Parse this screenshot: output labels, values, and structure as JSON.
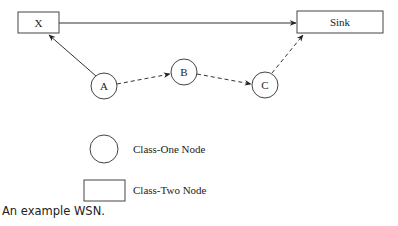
{
  "diagram": {
    "nodes": {
      "x": {
        "label": "X",
        "type": "class-two"
      },
      "sink": {
        "label": "Sink",
        "type": "class-two"
      },
      "a": {
        "label": "A",
        "type": "class-one"
      },
      "b": {
        "label": "B",
        "type": "class-one"
      },
      "c": {
        "label": "C",
        "type": "class-one"
      }
    },
    "edges": [
      {
        "from": "A",
        "to": "X",
        "style": "solid"
      },
      {
        "from": "X",
        "to": "Sink",
        "style": "solid"
      },
      {
        "from": "A",
        "to": "B",
        "style": "dashed"
      },
      {
        "from": "B",
        "to": "C",
        "style": "dashed"
      },
      {
        "from": "C",
        "to": "Sink",
        "style": "dashed"
      }
    ],
    "legend": {
      "class_one": "Class-One Node",
      "class_two": "Class-Two Node"
    }
  },
  "caption": "An example WSN."
}
